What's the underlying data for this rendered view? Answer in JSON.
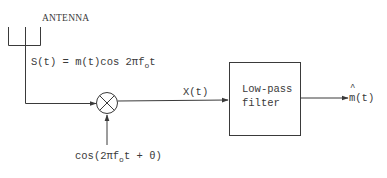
{
  "diagram": {
    "type": "block-diagram",
    "antenna": {
      "label": "ANTENNA"
    },
    "signals": {
      "received": {
        "lhs": "S(t)",
        "eq": " = ",
        "rhs_pre": "m(t)cos 2πf",
        "sub": "o",
        "rhs_post": "t"
      },
      "local_oscillator": {
        "pre": "cos(2πf",
        "sub": "o",
        "post": "t + θ)"
      },
      "mixer_output": "X(t)",
      "output": {
        "hat_char": "m",
        "rest": "(t)"
      }
    },
    "blocks": {
      "mixer": {
        "symbol": "⊗",
        "name": "multiplier"
      },
      "filter": {
        "line1": "Low-pass",
        "line2": "filter"
      }
    },
    "colors": {
      "stroke": "#3a3a3a",
      "background": "#ffffff"
    }
  }
}
